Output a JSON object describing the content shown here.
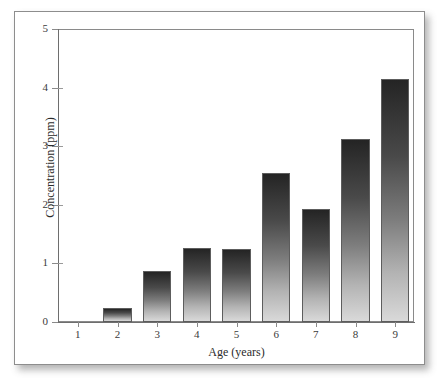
{
  "chart_data": {
    "type": "bar",
    "title": "",
    "subtitle": "",
    "xlabel": "Age (years)",
    "ylabel": "Concentration (ppm)",
    "categories": [
      "1",
      "2",
      "3",
      "4",
      "5",
      "6",
      "7",
      "8",
      "9"
    ],
    "values": [
      0,
      0.24,
      0.87,
      1.26,
      1.25,
      2.54,
      1.93,
      3.12,
      4.15
    ],
    "series": [
      {
        "name": "Concentration",
        "values": [
          0,
          0.24,
          0.87,
          1.26,
          1.25,
          2.54,
          1.93,
          3.12,
          4.15
        ]
      }
    ],
    "xlim": [
      0.5,
      9.5
    ],
    "ylim": [
      0,
      5
    ],
    "ytick_labels": [
      "0",
      "1",
      "2",
      "3",
      "4",
      "5"
    ],
    "ytick_values": [
      0,
      1,
      2,
      3,
      4,
      5
    ],
    "xtick_labels": [
      "1",
      "2",
      "3",
      "4",
      "5",
      "6",
      "7",
      "8",
      "9"
    ],
    "grid": false,
    "legend": false,
    "legend_position": "none",
    "bar_fill": "vertical-gradient-dark-to-light",
    "bar_color_top": "#242424",
    "bar_color_bottom": "#d9d9d9",
    "bar_edge_color": "#5d5d5d",
    "axis_color": "#8a8a8a",
    "background": "#ffffff",
    "annotations": []
  },
  "figure": {
    "frame_border_color": "#8d8d8d",
    "shadow": "drop-shadow-bottom-right"
  }
}
